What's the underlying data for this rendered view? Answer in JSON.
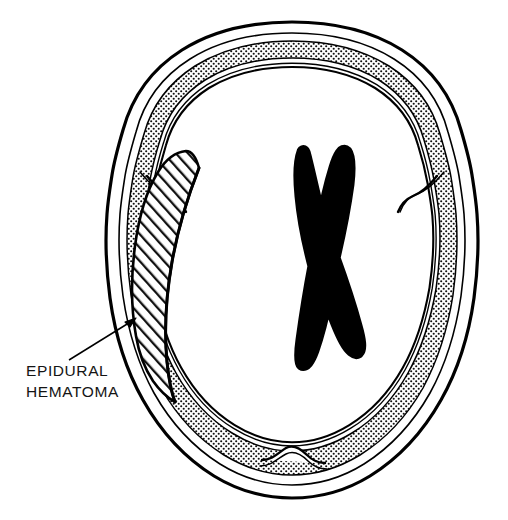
{
  "figure": {
    "type": "medical-line-illustration",
    "canvas": {
      "width": 508,
      "height": 520
    },
    "background_color": "#ffffff",
    "ink_color": "#000000"
  },
  "annotation": {
    "label_line_1": "EPIDURAL",
    "label_line_2": "HEMATOMA",
    "label_x": 26,
    "label_line_1_y": 376,
    "label_line_2_y": 397,
    "leader_start": {
      "x": 69,
      "y": 360
    },
    "leader_end": {
      "x": 134,
      "y": 320
    },
    "arrow_present": true
  },
  "anatomy": {
    "structures": [
      {
        "name": "outer-table",
        "label": "Outer table of skull",
        "fill": "#ffffff",
        "stroke": "#000000",
        "texture": "solid-outline"
      },
      {
        "name": "diploe",
        "label": "Diploe (cancellous bone)",
        "fill": "#ffffff",
        "stroke": "#000000",
        "texture": "stipple-crosshatch"
      },
      {
        "name": "inner-table",
        "label": "Inner table of skull",
        "fill": "#ffffff",
        "stroke": "#000000",
        "texture": "solid-outline"
      },
      {
        "name": "brain-parenchyma",
        "label": "Brain parenchyma",
        "fill": "#ffffff",
        "stroke": "none",
        "texture": "blank"
      },
      {
        "name": "epidural-hematoma",
        "label": "Epidural hematoma (biconvex / lenticular collection)",
        "fill": "#ffffff",
        "stroke": "#000000",
        "texture": "diagonal-hatch",
        "side": "left",
        "shape": "lentiform-biconvex"
      },
      {
        "name": "lateral-ventricles",
        "label": "Lateral ventricles",
        "fill": "#000000",
        "stroke": "#000000",
        "texture": "solid-black",
        "shape": "butterfly-x"
      },
      {
        "name": "occipital-protuberance",
        "label": "Internal occipital protuberance",
        "fill": "#ffffff",
        "stroke": "#000000",
        "texture": "solid-outline"
      },
      {
        "name": "sphenoid-ridge-left",
        "label": "Left sphenoid ridge notch",
        "fill": "#ffffff",
        "stroke": "#000000",
        "texture": "solid-outline"
      },
      {
        "name": "sphenoid-ridge-right",
        "label": "Right sphenoid ridge notch",
        "fill": "#ffffff",
        "stroke": "#000000",
        "texture": "solid-outline"
      }
    ]
  },
  "geometry": {
    "skull_outer_path": "M 292 22 C 336 22 372 31 402 50 C 432 69 452 97 461 130 C 466 147 470 162 472 175 C 474 188 476 200 477 214 C 479 240 478 268 474 298 C 469 334 458 370 441 400 C 423 432 399 458 370 476 C 344 492 316 498 292 498 C 268 498 240 492 214 476 C 185 458 161 432 143 400 C 126 370 115 334 110 298 C 106 268 105 240 107 214 C 108 200 110 188 112 175 C 114 162 118 147 123 130 C 132 97 152 69 182 50 C 212 31 248 22 292 22 Z",
    "skull_mid_path": "M 292 33 C 334 33 367 42 394 59 C 421 76 440 101 448 132 C 453 149 457 164 459 176 C 461 189 463 201 464 214 C 466 240 465 267 461 296 C 456 330 446 364 430 393 C 413 423 391 447 364 464 C 340 479 314 485 292 485 C 270 485 244 479 220 464 C 193 447 171 423 154 393 C 138 364 128 330 123 296 C 119 267 118 240 120 214 C 121 201 123 189 125 176 C 127 164 131 149 136 132 C 144 101 163 76 190 59 C 217 42 250 33 292 33 Z",
    "diploe_outer_path": "M 292 41 C 332 41 363 50 389 66 C 414 82 432 105 440 134 C 445 151 449 165 451 177 C 453 190 455 202 456 214 C 458 240 457 266 453 295 C 448 327 438 360 423 388 C 407 416 386 439 360 455 C 337 469 313 475 292 475 C 271 475 247 469 224 455 C 198 439 177 416 161 388 C 146 360 136 327 131 295 C 127 266 126 240 128 214 C 129 202 131 190 133 177 C 135 165 139 151 144 134 C 152 105 170 82 195 66 C 221 50 252 41 292 41 Z",
    "diploe_inner_path": "M 292 58 C 328 58 356 66 379 80 C 401 94 417 114 424 140 C 429 156 432 169 434 180 C 436 192 438 203 439 214 C 441 238 440 262 436 289 C 431 318 422 348 408 373 C 394 398 375 419 352 433 C 331 446 310 451 292 451 C 274 451 253 446 232 433 C 209 419 190 398 176 373 C 162 348 153 318 148 289 C 144 262 143 238 145 214 C 146 203 148 192 150 180 C 152 169 155 156 160 140 C 167 114 183 94 205 80 C 228 66 256 58 292 58 Z",
    "hematoma_path": "M 199 168 C 188 196 178 228 172 262 C 166 296 164 330 167 362 C 169 382 172 394 175 402 C 168 398 160 391 153 381 C 145 369 139 354 136 336 C 131 308 131 276 135 246 C 139 216 147 190 158 172 C 166 159 176 152 186 151 C 191 151 196 157 199 168 Z",
    "ventricle_path": "M 303 152 C 300 160 299 176 301 196 C 303 218 308 243 314 266 C 309 292 305 318 302 340 C 300 354 300 362 302 364 C 305 366 309 361 313 350 C 318 336 323 316 327 296 C 333 314 339 330 345 341 C 350 350 355 354 358 352 C 361 349 360 340 356 326 C 350 304 342 280 334 258 C 340 232 345 206 348 184 C 350 167 349 156 346 152 C 343 149 339 155 335 168 C 330 184 325 206 321 228 C 317 206 312 184 308 168 C 305 156 304 150 303 152 Z"
  }
}
